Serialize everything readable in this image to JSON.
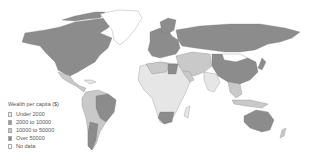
{
  "map": {
    "title": "Wealth per capita ($)",
    "legend": [
      {
        "label": "Under 2000",
        "color": "#ebebeb"
      },
      {
        "label": "2000 to 10000",
        "color": "#9a9a9a"
      },
      {
        "label": "10000 to 50000",
        "color": "#c8c8c8"
      },
      {
        "label": "Over 50000",
        "color": "#8a8a8a"
      },
      {
        "label": "No data",
        "color": "#ffffff"
      }
    ],
    "colors": {
      "high": "#8c8c8c",
      "mid": "#c9c9c9",
      "low": "#e6e6e6",
      "border": "#777777",
      "background": "#ffffff"
    }
  }
}
